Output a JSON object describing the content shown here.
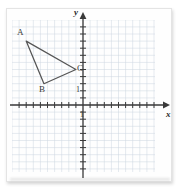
{
  "figure": {
    "axis_labels": {
      "x": "x",
      "y": "y"
    },
    "unit_markers": {
      "y_unit": "1",
      "x_unit": "1"
    },
    "colors": {
      "grid_line": "#ccd6e0",
      "axis_line": "#3a3a3a",
      "shape_stroke": "#555555",
      "label_text": "#3b3b3b",
      "paper": "#fefefe"
    }
  },
  "chart_data": {
    "type": "scatter",
    "title": "",
    "xlabel": "x",
    "ylabel": "y",
    "grid": true,
    "legend": "none",
    "xlim": [
      -10,
      10
    ],
    "ylim": [
      -9.5,
      12
    ],
    "x_tick_step": 1,
    "y_tick_step": 1,
    "unit_label_x": "1",
    "unit_label_y": "1",
    "annotations": [
      {
        "label": "A",
        "x": -8,
        "y": 9
      },
      {
        "label": "B",
        "x": -5.5,
        "y": 3
      },
      {
        "label": "C",
        "x": -1,
        "y": 5
      }
    ],
    "series": [
      {
        "name": "triangle ABC",
        "type": "polygon",
        "closed": true,
        "points": [
          {
            "label": "A",
            "x": -8,
            "y": 9
          },
          {
            "label": "B",
            "x": -5.5,
            "y": 3
          },
          {
            "label": "C",
            "x": -1,
            "y": 5
          }
        ]
      }
    ]
  },
  "geometry_px": {
    "origin": {
      "x": 83,
      "y": 105
    },
    "unit_px": 7.1,
    "grid_box": {
      "left": 12,
      "top": 20,
      "right": 155,
      "bottom": 172
    },
    "vertices_px": {
      "A": {
        "x": 24.5,
        "y": 41
      },
      "B": {
        "x": 44,
        "y": 84
      },
      "C": {
        "x": 75.5,
        "y": 68
      }
    },
    "label_positions": {
      "A": {
        "x": 17,
        "y": 30
      },
      "B": {
        "x": 40,
        "y": 87
      },
      "C": {
        "x": 77,
        "y": 66
      },
      "x_axis_name": {
        "x": 166,
        "y": 110
      },
      "y_axis_name": {
        "x": 74,
        "y": 11
      },
      "unit_y": {
        "x": 76,
        "y": 88
      },
      "unit_x": {
        "x": 79,
        "y": 112
      }
    }
  }
}
